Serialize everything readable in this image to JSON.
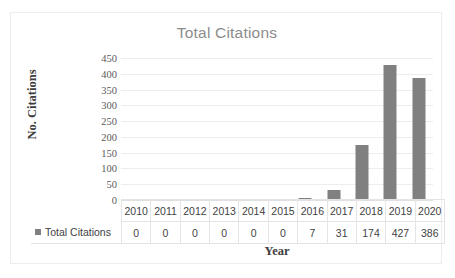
{
  "chart_data": {
    "type": "bar",
    "title": "Total Citations",
    "xlabel": "Year",
    "ylabel": "No. Citations",
    "categories": [
      "2010",
      "2011",
      "2012",
      "2013",
      "2014",
      "2015",
      "2016",
      "2017",
      "2018",
      "2019",
      "2020"
    ],
    "values": [
      0,
      0,
      0,
      0,
      0,
      0,
      7,
      31,
      174,
      427,
      386
    ],
    "series": [
      {
        "name": "Total Citations",
        "values": [
          0,
          0,
          0,
          0,
          0,
          0,
          7,
          31,
          174,
          427,
          386
        ]
      }
    ],
    "ylim": [
      0,
      450
    ],
    "ytick_labels": [
      "0",
      "50",
      "100",
      "150",
      "200",
      "250",
      "300",
      "350",
      "400",
      "450"
    ],
    "ytick_values": [
      0,
      50,
      100,
      150,
      200,
      250,
      300,
      350,
      400,
      450
    ],
    "grid": true,
    "legend_position": "data-table-left",
    "data_table_visible": true,
    "bar_color": "#808080",
    "gridline_color": "#ededed",
    "title_color": "#8c8c8c",
    "axis_label_color": "#3d3d3d"
  },
  "legend": {
    "marker_name": "series-color-swatch",
    "label": "Total Citations"
  }
}
